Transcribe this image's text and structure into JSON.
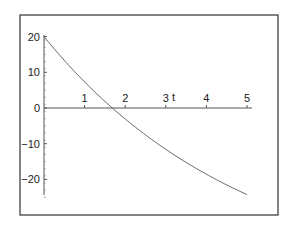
{
  "chart_data": {
    "type": "line",
    "title": "",
    "xlabel": "t",
    "ylabel": "",
    "xlim": [
      0,
      5
    ],
    "ylim": [
      -25,
      21
    ],
    "grid": false,
    "legend": null,
    "x_ticks": [
      "1",
      "2",
      "3",
      "4",
      "5"
    ],
    "y_ticks": [
      "20",
      "10",
      "0",
      "-10",
      "-20"
    ],
    "series": [
      {
        "name": "y(t)",
        "x": [
          0,
          0.5,
          1,
          1.5,
          2,
          2.5,
          3,
          3.5,
          4,
          4.5,
          5
        ],
        "values": [
          20,
          13.34,
          7.31,
          1.86,
          -3.08,
          -7.54,
          -11.58,
          -15.24,
          -18.54,
          -21.54,
          -24.25
        ]
      }
    ]
  },
  "colors": {
    "frame": "#333333",
    "axis": "#555555",
    "curve": "#666666",
    "text": "#222222"
  }
}
